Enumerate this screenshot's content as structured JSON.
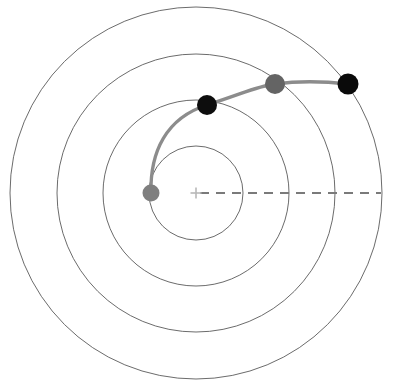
{
  "figure": {
    "title": "",
    "background_color": "#ffffff",
    "width": 395,
    "height": 383
  },
  "chart_data": {
    "type": "scatter",
    "title": "",
    "subtitle": "",
    "xlabel": "",
    "ylabel": "",
    "grid": false,
    "legend_position": "none",
    "coordinate_system": "polar",
    "center": {
      "x": 196,
      "y": 193,
      "label": "origin-marker",
      "marker": "plus",
      "color": "#b8b8b8",
      "size": 11
    },
    "radial_gridlines": {
      "name": "concentric-orbit-circles",
      "count": 4,
      "radii_px": [
        47,
        93,
        139,
        186
      ],
      "stroke": "#5a5a5a",
      "stroke_width": 0.9,
      "fill": "none"
    },
    "reference_axis": {
      "name": "reference-direction-dashed-line",
      "style": "dashed",
      "from": {
        "x": 196,
        "y": 193
      },
      "to": {
        "x": 381,
        "y": 193
      },
      "angle_deg": 0,
      "stroke": "#7a7a7a",
      "stroke_width": 2,
      "dash_pattern": "9,7"
    },
    "trajectory": {
      "name": "spiral-trajectory-path",
      "stroke": "#8c8c8c",
      "stroke_width": 3.4,
      "path": "M 151 193 C 150 152, 166 118, 207 105 C 247 92, 258 86, 275 84 C 305 80, 330 82, 348 84",
      "points": [
        {
          "x": 151,
          "y": 193
        },
        {
          "x": 207,
          "y": 105
        },
        {
          "x": 275,
          "y": 84
        },
        {
          "x": 348,
          "y": 84
        }
      ]
    },
    "markers": [
      {
        "name": "start-point",
        "x": 151,
        "y": 193,
        "r": 8.5,
        "color": "#7f7f7f",
        "radius_px": 45,
        "angle_deg": 180
      },
      {
        "name": "waypoint-1",
        "x": 207,
        "y": 105,
        "r": 10,
        "color": "#0d0d0d",
        "radius_px": 89,
        "angle_deg": 82
      },
      {
        "name": "waypoint-2",
        "x": 275,
        "y": 84,
        "r": 10,
        "color": "#646464",
        "radius_px": 135,
        "angle_deg": 54
      },
      {
        "name": "end-point",
        "x": 348,
        "y": 84,
        "r": 10.5,
        "color": "#0a0a0a",
        "radius_px": 183,
        "angle_deg": 35
      }
    ],
    "series": [
      {
        "name": "trajectory-markers",
        "values": [
          {
            "index": 0,
            "radius": 45,
            "angle_deg": 180,
            "color": "#7f7f7f"
          },
          {
            "index": 1,
            "radius": 89,
            "angle_deg": 82,
            "color": "#0d0d0d"
          },
          {
            "index": 2,
            "radius": 135,
            "angle_deg": 54,
            "color": "#646464"
          },
          {
            "index": 3,
            "radius": 183,
            "angle_deg": 35,
            "color": "#0a0a0a"
          }
        ]
      }
    ]
  }
}
